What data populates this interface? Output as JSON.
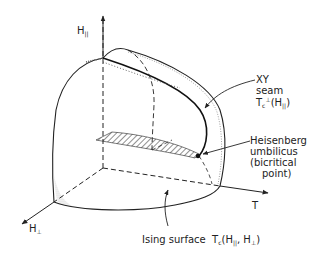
{
  "diagram": {
    "axes": {
      "vertical": {
        "label": "H",
        "subscript": "||"
      },
      "horizontal": {
        "label": "T"
      },
      "depth": {
        "label": "H",
        "subscript": "⊥"
      }
    },
    "annotations": {
      "xy_seam": {
        "line1": "XY",
        "line2": "seam",
        "line3_main": "T",
        "line3_sub": "c",
        "line3_sup": "⊥",
        "line3_rest": "(H",
        "line3_rest_sub": "||",
        "line3_close": ")"
      },
      "heisenberg": {
        "line1": "Heisenberg",
        "line2": "umbilicus",
        "line3": "(bicritical",
        "line4": "point)"
      },
      "ising": {
        "prefix": "Ising surface  T",
        "sub_c": "c",
        "args_open": "(H",
        "args_sub1": "||",
        "args_comma": ", H",
        "args_sub2": "⊥",
        "args_close": ")"
      }
    },
    "colors": {
      "ink": "#222222",
      "background": "#ffffff"
    }
  }
}
